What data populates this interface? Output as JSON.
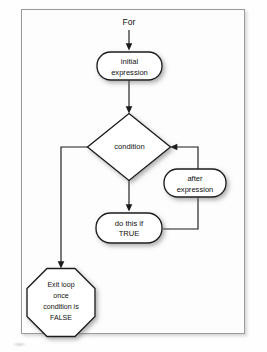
{
  "figure": {
    "background_color": "#fefefe",
    "frame_border_color": "#9a9a9a",
    "shape_fill": "#ffffff",
    "shape_stroke": "#1a1a1a",
    "connector_color": "#1a1a1a"
  },
  "labels": {
    "start": "For"
  },
  "nodes": {
    "initial_expression": {
      "shape": "rounded-rectangle",
      "line1": "initial",
      "line2": "expression"
    },
    "condition": {
      "shape": "diamond",
      "line1": "condition"
    },
    "after_expression": {
      "shape": "rounded-rectangle",
      "line1": "after",
      "line2": "expression"
    },
    "do_this_if_true": {
      "shape": "rounded-rectangle",
      "line1": "do this if",
      "line2": "TRUE"
    },
    "exit_loop": {
      "shape": "octagon",
      "line1": "Exit loop",
      "line2": "once",
      "line3": "condition is",
      "line4": "FALSE"
    }
  }
}
